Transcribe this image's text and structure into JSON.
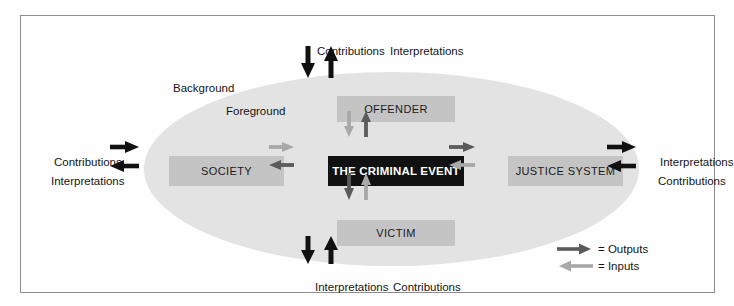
{
  "diagram": {
    "frame": {
      "border_color": "#8d8d8d"
    },
    "ellipse": {
      "fill": "#e3e3e3"
    },
    "zone_labels": {
      "background": "Background",
      "foreground": "Foreground"
    },
    "nodes": {
      "center": {
        "label": "THE CRIMINAL EVENT",
        "fill": "#111111",
        "text_color": "#ffffff"
      },
      "offender": {
        "label": "OFFENDER",
        "fill": "#c4c4c4",
        "text_color": "#1b1b1b"
      },
      "victim": {
        "label": "VICTIM",
        "fill": "#c4c4c4",
        "text_color": "#1b1b1b"
      },
      "society": {
        "label": "SOCIETY",
        "fill": "#c4c4c4",
        "text_color": "#1b1b1b"
      },
      "justice_system": {
        "label": "JUSTICE SYSTEM",
        "fill": "#c4c4c4",
        "text_color": "#1b1b1b"
      }
    },
    "outer_labels": {
      "top_left": "Contributions",
      "top_right": "Interpretations",
      "bottom_left": "Interpretations",
      "bottom_right": "Contributions",
      "left_upper": "Contributions",
      "left_lower": "Interpretations",
      "right_upper": "Interpretations",
      "right_lower": "Contributions"
    },
    "legend": {
      "outputs": "= Outputs",
      "inputs": "= Inputs",
      "output_color": "#5b5b5b",
      "input_color": "#a8a8a8"
    },
    "arrow_colors": {
      "black": "#111111",
      "dark_gray": "#5b5b5b",
      "light_gray": "#a8a8a8"
    }
  }
}
